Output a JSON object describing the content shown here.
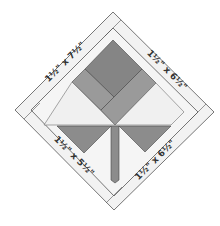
{
  "diagram": {
    "colors": {
      "background": "#ffffff",
      "strip_fill": "#f2f2f2",
      "outline": "#555555",
      "dark_gray": "#858585",
      "mid_gray": "#999999",
      "light_fill": "#f0f0f0"
    },
    "strip_labels": {
      "top_left": "1½\" x 7½\"",
      "top_right": "1½\" x 6½\"",
      "bottom_left": "1½\" x 5½\"",
      "bottom_right": "1½\" x 6½\""
    }
  }
}
